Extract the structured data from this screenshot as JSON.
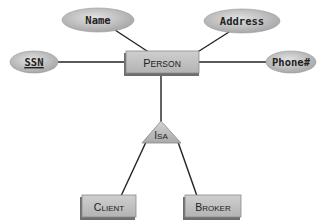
{
  "diagram": {
    "type": "ER diagram with ISA hierarchy",
    "entities": [
      {
        "id": "person",
        "label_first": "P",
        "label_rest": "ERSON",
        "full": "Person"
      },
      {
        "id": "client",
        "label_first": "C",
        "label_rest": "LIENT",
        "full": "Client"
      },
      {
        "id": "broker",
        "label_first": "B",
        "label_rest": "ROKER",
        "full": "Broker"
      }
    ],
    "attributes": [
      {
        "id": "name",
        "label": "Name",
        "owner": "person",
        "key": false
      },
      {
        "id": "address",
        "label": "Address",
        "owner": "person",
        "key": false
      },
      {
        "id": "ssn",
        "label": "SSN",
        "owner": "person",
        "key": true
      },
      {
        "id": "phone",
        "label": "Phone#",
        "owner": "person",
        "key": false
      }
    ],
    "isa": {
      "label_first": "I",
      "label_rest": "SA",
      "full": "IsA",
      "parent": "person",
      "children": [
        "client",
        "broker"
      ]
    },
    "colors": {
      "entity_fill": "#b9b9b9",
      "entity_shadow": "#7a7a7a",
      "attribute_fill": "#c4c4c4",
      "line": "#222222"
    }
  }
}
